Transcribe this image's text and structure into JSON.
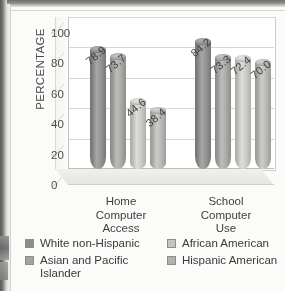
{
  "chart_data": {
    "type": "bar",
    "title": "",
    "subtitle": "",
    "xlabel": "",
    "ylabel": "PERCENTAGE",
    "ylim": [
      0,
      100
    ],
    "yticks": [
      0,
      20,
      40,
      60,
      80,
      100
    ],
    "grid": true,
    "legend_position": "bottom",
    "categories": [
      "Home Computer Access",
      "School Computer Use"
    ],
    "category_lines": [
      [
        "Home",
        "Computer",
        "Access"
      ],
      [
        "School",
        "Computer",
        "Use"
      ]
    ],
    "series": [
      {
        "name": "White non-Hispanic",
        "color": "#8d8d8b",
        "values": [
          78.9,
          84.2
        ],
        "labels": [
          "78.9",
          "84.2"
        ]
      },
      {
        "name": "Asian and Pacific Islander",
        "color": "#a3a3a1",
        "values": [
          73.7,
          73.3
        ],
        "labels": [
          "73.7",
          "73.3"
        ]
      },
      {
        "name": "African American",
        "color": "#c4c4c1",
        "values": [
          44.6,
          72.4
        ],
        "labels": [
          "44.6",
          "72.4"
        ]
      },
      {
        "name": "Hispanic American",
        "color": "#b2b2af",
        "values": [
          38.4,
          70.0
        ],
        "labels": [
          "38.4",
          "70.0"
        ]
      }
    ]
  },
  "legend": {
    "left_items": [
      "White non-Hispanic",
      "Asian and Pacific Islander"
    ],
    "right_items": [
      "African American",
      "Hispanic American"
    ]
  },
  "page": {
    "caption_ghost": ""
  }
}
